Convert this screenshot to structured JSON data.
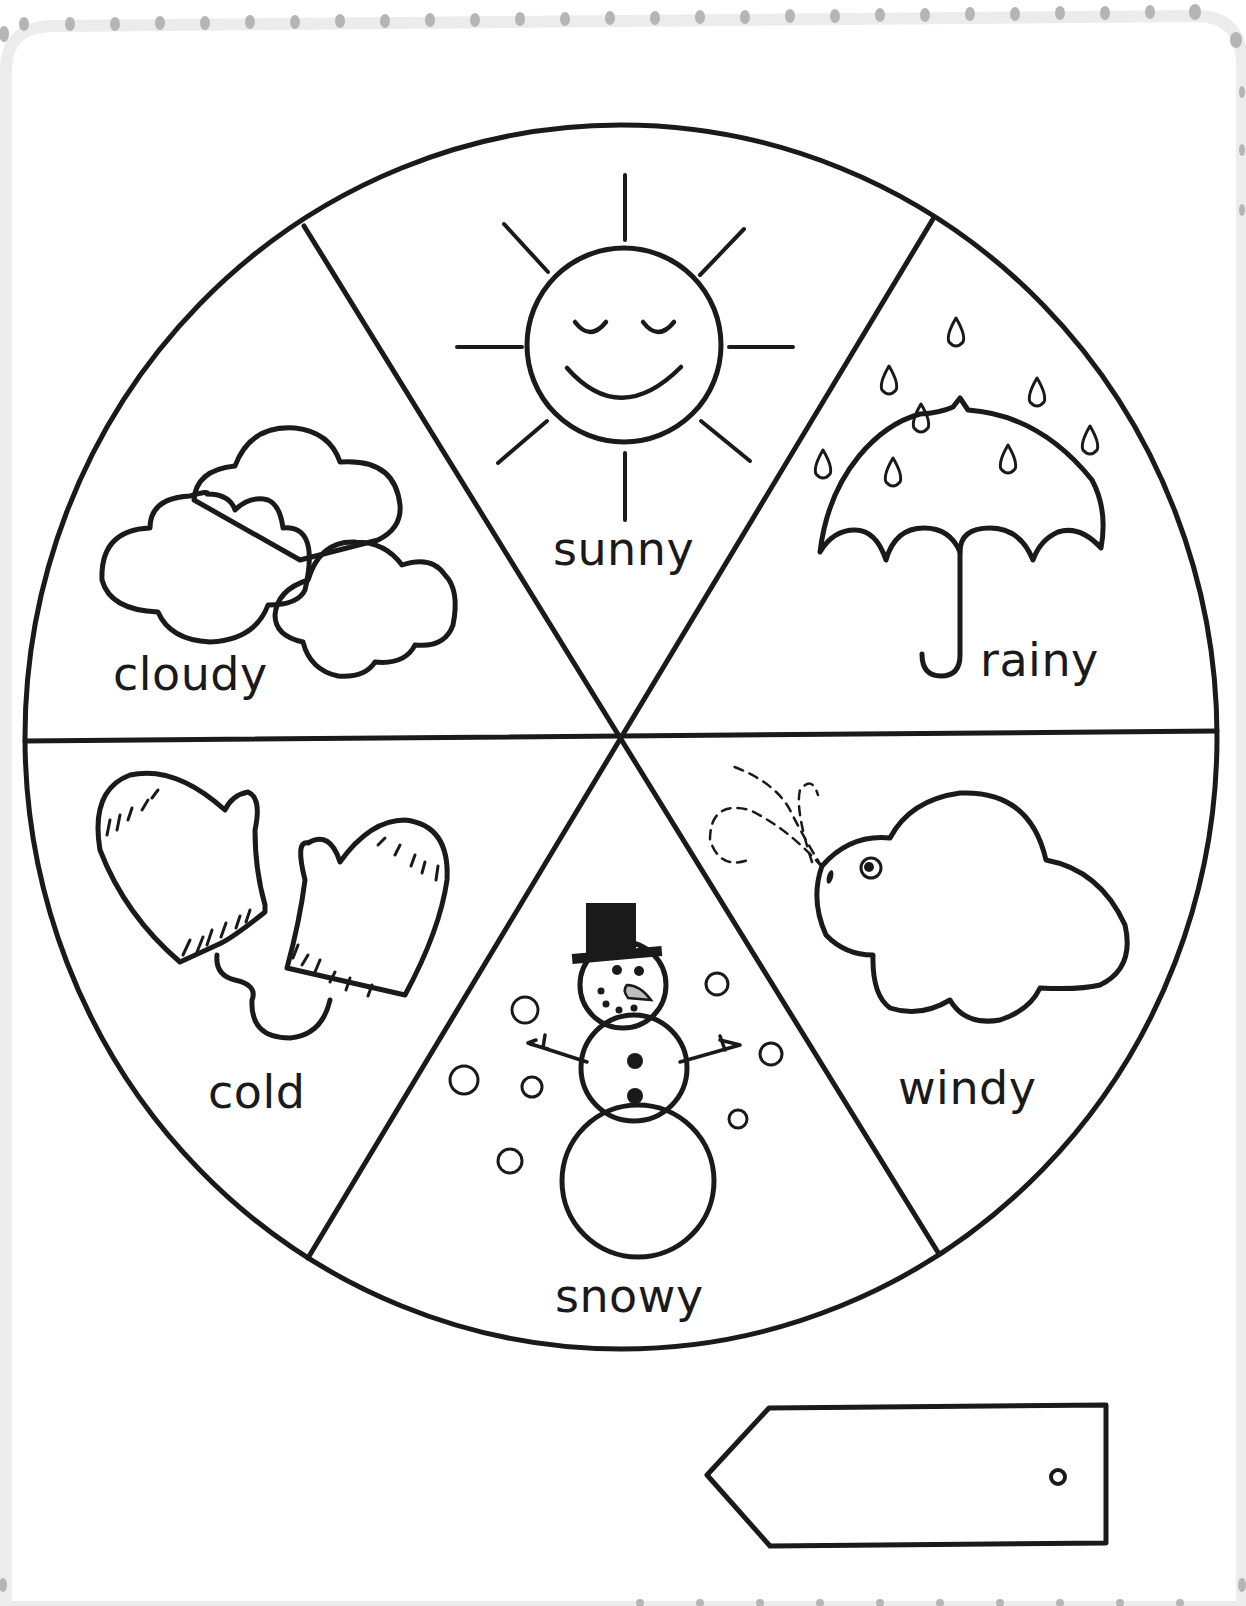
{
  "worksheet": {
    "type": "weather-wheel",
    "colors": {
      "ink": "#1a1a1a",
      "paper": "#ffffff",
      "border_dots": "#b8b8b8",
      "border_band": "#ececec",
      "carrot": "#bdbdbd"
    },
    "wheel": {
      "segments": [
        {
          "label": "sunny",
          "icon": "sun-icon"
        },
        {
          "label": "rainy",
          "icon": "umbrella-icon"
        },
        {
          "label": "windy",
          "icon": "windy-cloud-icon"
        },
        {
          "label": "snowy",
          "icon": "snowman-icon"
        },
        {
          "label": "cold",
          "icon": "mittens-icon"
        },
        {
          "label": "cloudy",
          "icon": "clouds-icon"
        }
      ]
    },
    "pointer_tag": {
      "icon": "arrow-tag-icon",
      "hole": "tag-hole-icon"
    }
  }
}
